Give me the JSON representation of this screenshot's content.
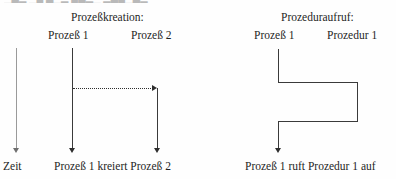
{
  "page": {
    "background_color": "#fefefe",
    "ink_color": "#2e2e2e",
    "faint_ink_color": "#9a9a9a",
    "clipped_top_text": "▁▃▂ ▁▄ ▃▁▂ ▄▃▂▁ ▂▃▄▁▃▂"
  },
  "time_axis": {
    "label": "Zeit"
  },
  "diagrams": [
    {
      "id": "prozesskreation",
      "title": "Prozeßkreation:",
      "columns": [
        {
          "id": "prozess-1",
          "label": "Prozeß 1"
        },
        {
          "id": "prozess-2",
          "label": "Prozeß 2"
        }
      ],
      "message": {
        "style": "dotted",
        "direction": "right",
        "from": "prozess-1",
        "to": "prozess-2"
      },
      "caption": "Prozeß 1 kreiert Prozeß 2"
    },
    {
      "id": "prozeduraufruf",
      "title": "Prozeduraufruf:",
      "columns": [
        {
          "id": "prozess-1",
          "label": "Prozeß 1"
        },
        {
          "id": "prozedur-1",
          "label": "Prozedur 1"
        }
      ],
      "message": {
        "style": "solid",
        "direction": "right-then-back",
        "from": "prozess-1",
        "to": "prozedur-1"
      },
      "caption": "Prozeß 1 ruft Prozedur 1 auf"
    }
  ]
}
